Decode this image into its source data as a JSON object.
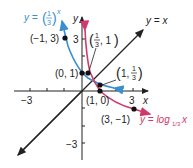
{
  "figure": {
    "title": "",
    "axes": {
      "x_label": "x",
      "y_label": "y",
      "x_ticks": [
        -3,
        -2,
        -1,
        1,
        2,
        3
      ],
      "y_ticks": [
        -3,
        -2,
        -1,
        1,
        2,
        3
      ],
      "x_tick_labels": [
        {
          "value": -3,
          "text": "−3"
        },
        {
          "value": 3,
          "text": "3"
        }
      ],
      "y_tick_labels": [
        {
          "value": 3,
          "text": "3"
        },
        {
          "value": -3,
          "text": "−3"
        }
      ]
    },
    "curves": [
      {
        "name": "exponential",
        "label_prefix": "y = ",
        "label_base": "1/3",
        "label_exp": "x",
        "color": "#3a8fd0"
      },
      {
        "name": "logarithm",
        "label_prefix": "y = log",
        "label_sub": "1/3",
        "label_arg": "x",
        "color": "#d03a6a"
      },
      {
        "name": "identity",
        "label": "y = x",
        "color": "#222222"
      }
    ],
    "points": [
      {
        "label": "(−1, 3)",
        "x": -1,
        "y": 3
      },
      {
        "label": "(0, 1)",
        "x": 0,
        "y": 1
      },
      {
        "label_parts": [
          "1",
          "3",
          ", 1"
        ],
        "x": 0.333,
        "y": 1
      },
      {
        "label_parts": [
          "1, ",
          "1",
          "3"
        ],
        "x": 1,
        "y": 0.333
      },
      {
        "label": "(1, 0)",
        "x": 1,
        "y": 0
      },
      {
        "label": "(3, −1)",
        "x": 3,
        "y": -1
      }
    ]
  }
}
